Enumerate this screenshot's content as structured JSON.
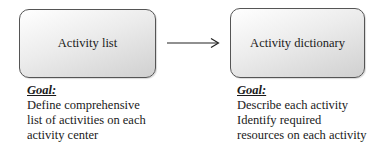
{
  "diagram": {
    "nodes": [
      {
        "id": "activity-list",
        "label": "Activity list",
        "goal": {
          "title": "Goal:",
          "lines": [
            "Define comprehensive",
            "list of activities on each",
            "activity center"
          ]
        }
      },
      {
        "id": "activity-dictionary",
        "label": "Activity dictionary",
        "goal": {
          "title": "Goal:",
          "lines": [
            "Describe each activity",
            "Identify required",
            "resources on each activity"
          ]
        }
      }
    ],
    "edges": [
      {
        "from": "activity-list",
        "to": "activity-dictionary",
        "style": "solid-arrow"
      }
    ],
    "colors": {
      "box_border": "#555555",
      "box_fill_light": "#ffffff",
      "box_fill_dark": "#d0d0d0",
      "text": "#1a1a1a"
    }
  }
}
